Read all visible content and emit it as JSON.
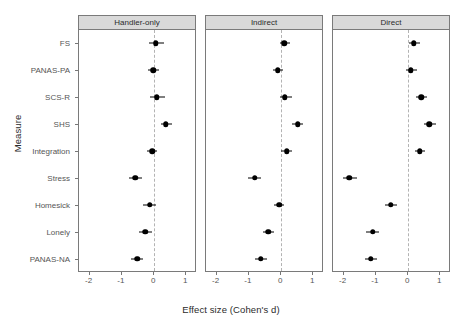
{
  "chart_data": {
    "type": "scatter",
    "subtype": "forest-plot",
    "title": "",
    "xlabel": "Effect size (Cohen's d)",
    "ylabel": "Measure",
    "xlim": [
      -2.3,
      1.3
    ],
    "xticks": [
      -2,
      -1,
      0,
      1
    ],
    "xtick_labels": [
      "-2",
      "-1",
      "0",
      "1"
    ],
    "grid": false,
    "legend": "none",
    "reference_line": 0,
    "reference_line_style": "dashed",
    "categories": [
      "FS",
      "PANAS-PA",
      "SCS-R",
      "SHS",
      "Integration",
      "Stress",
      "Homesick",
      "Lonely",
      "PANAS-NA"
    ],
    "panels": [
      {
        "label": "Handler-only",
        "values": [
          0.05,
          -0.03,
          0.08,
          0.36,
          -0.06,
          -0.58,
          -0.14,
          -0.28,
          -0.53
        ],
        "ci_low": [
          -0.17,
          -0.19,
          -0.13,
          0.2,
          -0.22,
          -0.79,
          -0.34,
          -0.47,
          -0.72
        ],
        "ci_high": [
          0.3,
          0.14,
          0.33,
          0.55,
          0.1,
          -0.36,
          0.06,
          -0.08,
          -0.33
        ]
      },
      {
        "label": "Indirect",
        "values": [
          0.1,
          -0.1,
          0.12,
          0.51,
          0.17,
          -0.82,
          -0.06,
          -0.4,
          -0.63
        ],
        "ci_low": [
          -0.04,
          -0.25,
          -0.03,
          0.35,
          0.0,
          -1.03,
          -0.22,
          -0.57,
          -0.82
        ],
        "ci_high": [
          0.28,
          0.06,
          0.33,
          0.68,
          0.35,
          -0.61,
          0.1,
          -0.23,
          -0.45
        ]
      },
      {
        "label": "Direct",
        "values": [
          0.17,
          0.08,
          0.4,
          0.66,
          0.36,
          -1.82,
          -0.54,
          -1.1,
          -1.16
        ],
        "ci_low": [
          0.03,
          -0.06,
          0.25,
          0.5,
          0.21,
          -2.02,
          -0.72,
          -1.3,
          -1.35
        ],
        "ci_high": [
          0.38,
          0.27,
          0.58,
          0.86,
          0.53,
          -1.6,
          -0.36,
          -0.9,
          -0.96
        ]
      }
    ]
  },
  "style": {
    "strip_bg": "#d9d9d9",
    "border": "#7a7a7a",
    "point_color": "#000000",
    "refline_color": "#b3b3b3",
    "text_color": "#4d4d4d"
  }
}
